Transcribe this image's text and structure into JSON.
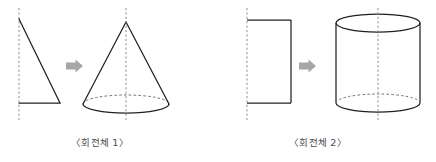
{
  "figure": {
    "title": "",
    "background_color": "#ffffff",
    "stroke_color": "#231f20",
    "dash_color": "#8e8e8e",
    "arrow_color": "#a6a6a6",
    "caption_color": "#4a4a4a",
    "panels": [
      {
        "id": "panel-1",
        "caption": "〈회전체 1〉",
        "source_shape_name": "right-triangle",
        "result_shape_name": "cone",
        "arrow_label": "rotates-to",
        "axis_label": "rotation-axis",
        "source_shape": {
          "type": "triangle",
          "apex": [
            19,
            19
          ],
          "base_left": [
            19,
            103
          ],
          "base_right": [
            60,
            103
          ]
        },
        "result_shape": {
          "type": "cone",
          "apex": [
            126,
            22
          ],
          "base_center": [
            126,
            104
          ],
          "base_rx": 43,
          "base_ry": 9
        },
        "axes": [
          {
            "x": 19,
            "y_top": 8,
            "y_bottom": 122
          },
          {
            "x": 126,
            "y_top": 8,
            "y_bottom": 122
          }
        ],
        "arrow": {
          "x": 66,
          "y": 66,
          "width": 17,
          "height": 13
        }
      },
      {
        "id": "panel-2",
        "caption": "〈회전체 2〉",
        "source_shape_name": "rectangle",
        "result_shape_name": "cylinder",
        "arrow_label": "rotates-to",
        "axis_label": "rotation-axis",
        "source_shape": {
          "type": "rectangle",
          "left": 247,
          "right": 291,
          "top": 20,
          "bottom": 103
        },
        "result_shape": {
          "type": "cylinder",
          "center_x": 378,
          "rx": 42,
          "ry": 9,
          "top_cy": 23,
          "bottom_cy": 103
        },
        "axes": [
          {
            "x": 247,
            "y_top": 8,
            "y_bottom": 122
          },
          {
            "x": 378,
            "y_top": 8,
            "y_bottom": 122
          }
        ],
        "arrow": {
          "x": 299,
          "y": 66,
          "width": 17,
          "height": 13
        }
      }
    ]
  }
}
